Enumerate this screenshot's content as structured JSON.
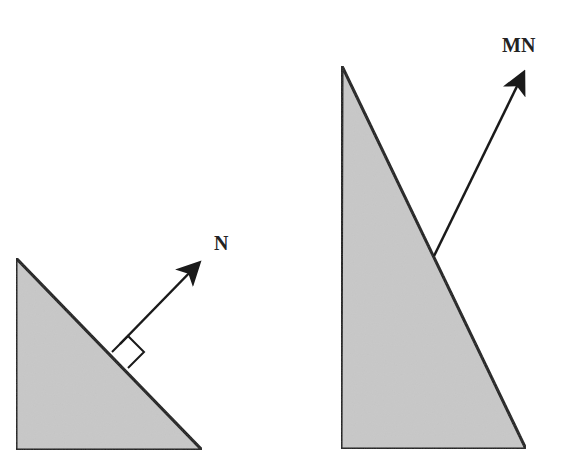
{
  "diagram": {
    "colors": {
      "fill": "#c8c8c8",
      "stroke": "#1a1a1a",
      "background": "#ffffff"
    },
    "left_figure": {
      "shape": "right-triangle",
      "vertices": [
        [
          16,
          258
        ],
        [
          16,
          450
        ],
        [
          202,
          450
        ]
      ],
      "normal_vector": {
        "label": "N",
        "start": [
          112,
          352
        ],
        "end": [
          202,
          260
        ],
        "label_pos": [
          222,
          250
        ],
        "right_angle_marker": true
      }
    },
    "right_figure": {
      "shape": "right-triangle",
      "vertices": [
        [
          342,
          66
        ],
        [
          341,
          449
        ],
        [
          526,
          449
        ]
      ],
      "transformed_vector": {
        "label": "MN",
        "start": [
          434,
          256
        ],
        "end": [
          526,
          68
        ],
        "label_pos": [
          530,
          52
        ],
        "right_angle_marker": false
      }
    }
  }
}
